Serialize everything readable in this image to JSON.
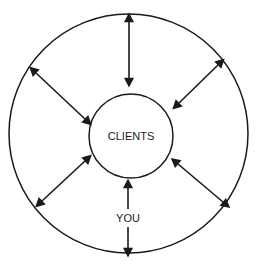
{
  "canvas": {
    "width": 259,
    "height": 269,
    "background": "#ffffff"
  },
  "style": {
    "stroke_color": "#1a1a1a",
    "circle_stroke_width": 1.5,
    "arrow_stroke_width": 1.6,
    "text_color": "#1a1a1a"
  },
  "diagram": {
    "type": "concentric-radial-arrows",
    "outer_circle": {
      "label": "",
      "cx": 128.5,
      "cy": 133.5,
      "r": 119.5
    },
    "inner_circle": {
      "label": "CLIENTS",
      "font_size": 11,
      "cx": 131,
      "cy": 136,
      "r": 42
    },
    "center_label": "CLIENTS",
    "spoke_label": "YOU",
    "spoke_label_font_size": 11,
    "arrows": [
      {
        "name": "arrow-top",
        "direction": "bidirectional",
        "x1": 129,
        "y1": 78,
        "x2": 129,
        "y2": 22,
        "label": ""
      },
      {
        "name": "arrow-upper-left",
        "direction": "bidirectional",
        "x1": 85,
        "y1": 119,
        "x2": 36,
        "y2": 73,
        "label": ""
      },
      {
        "name": "arrow-upper-right",
        "direction": "bidirectional",
        "x1": 179,
        "y1": 103,
        "x2": 218,
        "y2": 65,
        "label": ""
      },
      {
        "name": "arrow-lower-left",
        "direction": "bidirectional",
        "x1": 85,
        "y1": 161,
        "x2": 42,
        "y2": 201,
        "label": ""
      },
      {
        "name": "arrow-lower-right",
        "direction": "bidirectional",
        "x1": 178,
        "y1": 164,
        "x2": 223,
        "y2": 202,
        "label": ""
      },
      {
        "name": "arrow-bottom-you",
        "direction": "bidirectional",
        "x1": 128,
        "y1": 188,
        "x2": 128,
        "y2": 248,
        "label": "YOU",
        "label_x": 128,
        "label_y": 218
      }
    ]
  }
}
